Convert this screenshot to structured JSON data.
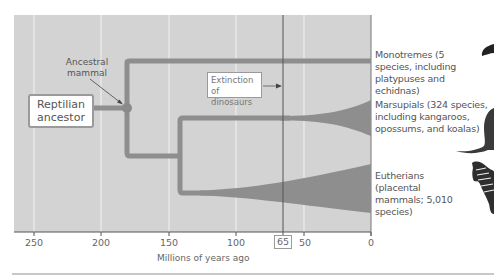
{
  "diagram": {
    "type": "phylogenetic-tree",
    "title": "",
    "colors": {
      "plot_background": "#d3d3d3",
      "branch": "#8e8e8e",
      "gridline": "#f2f2f2",
      "extinction_line": "#555555",
      "box_border": "#9a9a9a",
      "text": "#555555"
    },
    "root_box": {
      "label": "Reptilian ancestor"
    },
    "node_label": {
      "text": "Ancestral mammal"
    },
    "event_box": {
      "label": "Extinction of dinosaurs",
      "age_mya": 65
    },
    "taxa": [
      {
        "name": "Monotremes",
        "label": "Monotremes (5 species, including platypuses and echidnas)",
        "species": 5
      },
      {
        "name": "Marsupials",
        "label": "Marsupials (324 species, including kangaroos, opossums, and koalas)",
        "species": 324
      },
      {
        "name": "Eutherians",
        "label": "Eutherians (placental mammals; 5,010 species)",
        "species": 5010
      }
    ],
    "branch_points_mya": {
      "ancestral_mammal": 180,
      "marsupial_eutherian_split": 140
    },
    "axis": {
      "title": "Millions of years ago",
      "ticks": [
        "250",
        "200",
        "150",
        "100",
        "65",
        "50",
        "0"
      ],
      "highlighted_tick": "65",
      "range": [
        265,
        0
      ]
    },
    "images": [
      "platypus-icon",
      "kangaroo-icon",
      "zebra-icon"
    ]
  }
}
